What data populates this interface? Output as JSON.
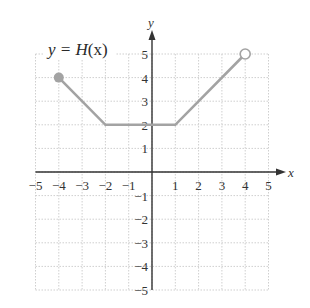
{
  "chart_data": {
    "type": "line",
    "title": "y = H(x)",
    "xlabel": "x",
    "ylabel": "y",
    "xlim": [
      -5,
      5
    ],
    "ylim": [
      -5,
      5
    ],
    "grid": true,
    "x_ticks": [
      -5,
      -4,
      -3,
      -2,
      -1,
      1,
      2,
      3,
      4,
      5
    ],
    "y_ticks": [
      -5,
      -4,
      -3,
      -2,
      -1,
      1,
      2,
      3,
      4,
      5
    ],
    "series": [
      {
        "name": "H(x)",
        "points": [
          [
            -4,
            4
          ],
          [
            -2,
            2
          ],
          [
            1,
            2
          ],
          [
            4,
            5
          ]
        ],
        "endpoints": [
          {
            "x": -4,
            "y": 4,
            "style": "closed"
          },
          {
            "x": 4,
            "y": 5,
            "style": "open"
          }
        ],
        "color": "#a3a3a3"
      }
    ]
  },
  "labels": {
    "function_prefix": "y = ",
    "function_name": "H",
    "function_arg": "(x)",
    "x_axis": "x",
    "y_axis": "y"
  },
  "colors": {
    "curve": "#a3a3a3",
    "axis": "#333333",
    "grid": "#cfcfcf"
  }
}
